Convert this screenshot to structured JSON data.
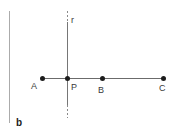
{
  "figure": {
    "panel_label": "b",
    "line_label": "r",
    "point_labels": {
      "A": "A",
      "P": "P",
      "B": "B",
      "C": "C"
    },
    "colors": {
      "background": "#ffffff",
      "panel_border": "#ababab",
      "segment_line": "#6b6b6b",
      "vertical_line": "#767676",
      "dotted_line": "#8a8a8a",
      "point_dot": "#1c1c1c",
      "label_text": "#3a3a3a"
    }
  }
}
